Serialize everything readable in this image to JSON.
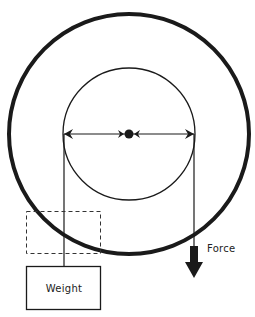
{
  "diagram": {
    "labels": {
      "force": "Force",
      "weight": "Weight"
    },
    "components": {
      "outer_wheel": "outer-wheel",
      "inner_axle": "inner-axle",
      "hub": "center-hub",
      "diameter_arrow": "double-headed-diameter-arrow",
      "rope_left": "rope-to-weight",
      "rope_right": "rope-to-force",
      "weight_box": "weight-block",
      "dashed_box": "weight-raised-position",
      "force_arrow": "downward-force-arrow"
    },
    "colors": {
      "ink": "#1a1a1a",
      "background": "#ffffff"
    }
  }
}
